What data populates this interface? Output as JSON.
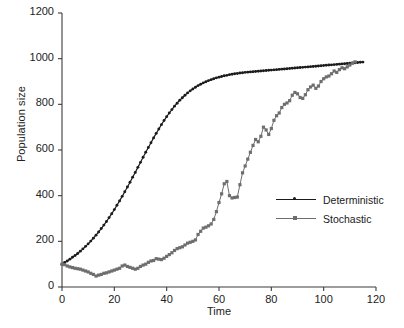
{
  "chart_data": {
    "type": "line",
    "title": "",
    "xlabel": "Time",
    "ylabel": "Population size",
    "xlim": [
      0,
      120
    ],
    "ylim": [
      0,
      1200
    ],
    "xticks": [
      0,
      20,
      40,
      60,
      80,
      100,
      120
    ],
    "yticks": [
      0,
      200,
      400,
      600,
      800,
      1000,
      1200
    ],
    "grid": false,
    "legend_position": "center-right",
    "series": [
      {
        "name": "Deterministic",
        "color": "#1b1b1b",
        "marker": "dot",
        "x": [
          0,
          1,
          2,
          3,
          4,
          5,
          6,
          7,
          8,
          9,
          10,
          11,
          12,
          13,
          14,
          15,
          16,
          17,
          18,
          19,
          20,
          21,
          22,
          23,
          24,
          25,
          26,
          27,
          28,
          29,
          30,
          31,
          32,
          33,
          34,
          35,
          36,
          37,
          38,
          39,
          40,
          41,
          42,
          43,
          44,
          45,
          46,
          47,
          48,
          49,
          50,
          51,
          52,
          53,
          54,
          55,
          56,
          57,
          58,
          59,
          60,
          61,
          62,
          63,
          64,
          65,
          66,
          67,
          68,
          69,
          70,
          71,
          72,
          73,
          74,
          75,
          76,
          77,
          78,
          79,
          80,
          81,
          82,
          83,
          84,
          85,
          86,
          87,
          88,
          89,
          90,
          91,
          92,
          93,
          94,
          95,
          96,
          97,
          98,
          99,
          100,
          101,
          102,
          103,
          104,
          105,
          106,
          107,
          108,
          109,
          110,
          111,
          112,
          113,
          114,
          115
        ],
        "y": [
          100,
          107,
          114,
          122,
          130,
          138,
          147,
          157,
          167,
          178,
          189,
          201,
          214,
          227,
          241,
          256,
          271,
          287,
          304,
          321,
          339,
          358,
          377,
          397,
          417,
          438,
          459,
          481,
          502,
          524,
          546,
          568,
          590,
          611,
          632,
          653,
          673,
          692,
          711,
          729,
          746,
          762,
          777,
          792,
          805,
          818,
          829,
          840,
          850,
          859,
          867,
          875,
          882,
          888,
          894,
          899,
          904,
          908,
          912,
          916,
          919,
          922,
          925,
          927,
          930,
          932,
          934,
          935,
          937,
          938,
          940,
          941,
          942,
          943,
          944,
          945,
          946,
          947,
          948,
          949,
          950,
          951,
          952,
          953,
          954,
          955,
          956,
          957,
          958,
          959,
          960,
          961,
          962,
          963,
          964,
          965,
          966,
          967,
          968,
          969,
          970,
          971,
          972,
          973,
          974,
          975,
          976,
          977,
          978,
          979,
          980,
          981,
          982,
          983,
          984,
          985
        ]
      },
      {
        "name": "Stochastic",
        "color": "#6e6e6e",
        "marker": "square",
        "x": [
          0,
          1,
          2,
          3,
          4,
          5,
          6,
          7,
          8,
          9,
          10,
          11,
          12,
          13,
          14,
          15,
          16,
          17,
          18,
          19,
          20,
          21,
          22,
          23,
          24,
          25,
          26,
          27,
          28,
          29,
          30,
          31,
          32,
          33,
          34,
          35,
          36,
          37,
          38,
          39,
          40,
          41,
          42,
          43,
          44,
          45,
          46,
          47,
          48,
          49,
          50,
          51,
          52,
          53,
          54,
          55,
          56,
          57,
          58,
          59,
          60,
          61,
          62,
          63,
          64,
          65,
          66,
          67,
          68,
          69,
          70,
          71,
          72,
          73,
          74,
          75,
          76,
          77,
          78,
          79,
          80,
          81,
          82,
          83,
          84,
          85,
          86,
          87,
          88,
          89,
          90,
          91,
          92,
          93,
          94,
          95,
          96,
          97,
          98,
          99,
          100,
          101,
          102,
          103,
          104,
          105,
          106,
          107,
          108,
          109,
          110,
          111,
          112
        ],
        "y": [
          100,
          98,
          92,
          88,
          85,
          82,
          80,
          78,
          74,
          70,
          66,
          60,
          55,
          48,
          52,
          55,
          60,
          62,
          66,
          70,
          74,
          78,
          82,
          92,
          96,
          90,
          86,
          82,
          78,
          82,
          90,
          96,
          100,
          108,
          114,
          116,
          124,
          122,
          120,
          126,
          134,
          142,
          150,
          160,
          168,
          172,
          176,
          184,
          192,
          196,
          200,
          206,
          230,
          244,
          258,
          262,
          268,
          276,
          296,
          330,
          370,
          408,
          452,
          462,
          400,
          390,
          392,
          394,
          448,
          500,
          530,
          560,
          590,
          620,
          646,
          636,
          660,
          700,
          688,
          668,
          694,
          730,
          750,
          762,
          786,
          800,
          806,
          816,
          840,
          852,
          846,
          830,
          826,
          842,
          864,
          876,
          884,
          870,
          880,
          900,
          912,
          920,
          924,
          934,
          946,
          940,
          952,
          960,
          956,
          964,
          972,
          980,
          986
        ]
      }
    ]
  },
  "legend": {
    "items": [
      {
        "label": "Deterministic"
      },
      {
        "label": "Stochastic"
      }
    ]
  },
  "axes": {
    "ylabel": "Population size",
    "xlabel": "Time"
  }
}
